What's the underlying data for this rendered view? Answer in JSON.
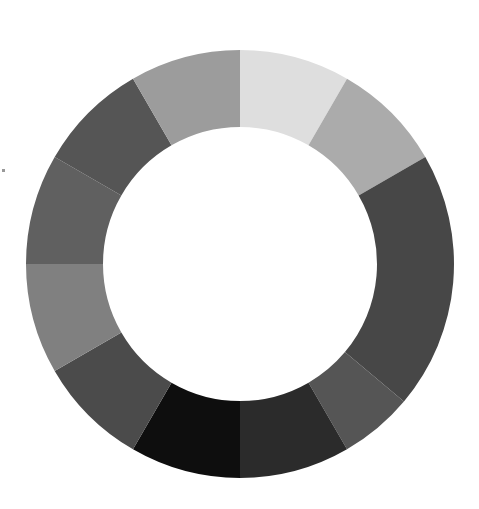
{
  "title": "",
  "chart_data": {
    "type": "pie",
    "variant": "donut",
    "center": [
      240,
      264
    ],
    "outer_radius": 214,
    "inner_radius": 137,
    "legend": "none",
    "labels_visible": false,
    "segments": [
      {
        "start_deg": 0,
        "end_deg": 30,
        "value": 8.33,
        "color": "#dedede"
      },
      {
        "start_deg": 30,
        "end_deg": 60,
        "value": 8.33,
        "color": "#ababab"
      },
      {
        "start_deg": 60,
        "end_deg": 130,
        "value": 19.44,
        "color": "#474747"
      },
      {
        "start_deg": 130,
        "end_deg": 150,
        "value": 5.56,
        "color": "#555555"
      },
      {
        "start_deg": 150,
        "end_deg": 180,
        "value": 8.33,
        "color": "#2b2b2b"
      },
      {
        "start_deg": 180,
        "end_deg": 210,
        "value": 8.33,
        "color": "#0e0e0e"
      },
      {
        "start_deg": 210,
        "end_deg": 240,
        "value": 8.33,
        "color": "#4b4b4b"
      },
      {
        "start_deg": 240,
        "end_deg": 270,
        "value": 8.33,
        "color": "#808080"
      },
      {
        "start_deg": 270,
        "end_deg": 300,
        "value": 8.33,
        "color": "#606060"
      },
      {
        "start_deg": 300,
        "end_deg": 330,
        "value": 8.33,
        "color": "#555555"
      },
      {
        "start_deg": 330,
        "end_deg": 360,
        "value": 8.33,
        "color": "#9c9c9c"
      }
    ]
  }
}
